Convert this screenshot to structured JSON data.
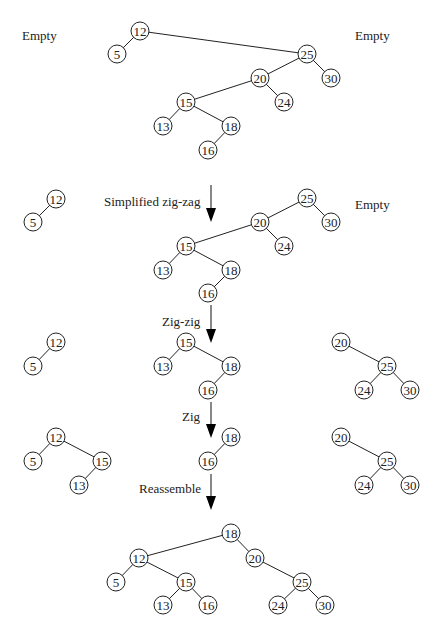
{
  "node_radius": 9,
  "labels": [
    {
      "id": "empty-left-1",
      "text": "Empty",
      "x": 22,
      "y": 40
    },
    {
      "id": "empty-right-1",
      "text": "Empty",
      "x": 355,
      "y": 40
    },
    {
      "id": "empty-right-2",
      "text": "Empty",
      "x": 355,
      "y": 209
    },
    {
      "id": "step-simplified-zig-zag",
      "text": "Simplified zig-zag",
      "x": 104,
      "y": 206
    },
    {
      "id": "step-zig-zig",
      "text": "Zig-zig",
      "x": 162,
      "y": 326
    },
    {
      "id": "step-zig",
      "text": "Zig",
      "x": 182,
      "y": 421
    },
    {
      "id": "step-reassemble",
      "text": "Reassemble",
      "x": 139,
      "y": 493
    }
  ],
  "arrows": [
    {
      "id": "arrow-simplified-zig-zag",
      "x": 211,
      "y1": 185,
      "y2": 222
    },
    {
      "id": "arrow-zig-zig",
      "x": 211,
      "y1": 305,
      "y2": 343
    },
    {
      "id": "arrow-zig",
      "x": 211,
      "y1": 402,
      "y2": 438
    },
    {
      "id": "arrow-reassemble",
      "x": 211,
      "y1": 474,
      "y2": 510
    }
  ],
  "stages": [
    {
      "name": "initial",
      "nodes": [
        {
          "id": "n12",
          "v": "12",
          "x": 140,
          "y": 31
        },
        {
          "id": "n5",
          "v": "5",
          "x": 117,
          "y": 54
        },
        {
          "id": "n25",
          "v": "25",
          "x": 307,
          "y": 54
        },
        {
          "id": "n20",
          "v": "20",
          "x": 260,
          "y": 78
        },
        {
          "id": "n30",
          "v": "30",
          "x": 331,
          "y": 78
        },
        {
          "id": "n15",
          "v": "15",
          "x": 186,
          "y": 102
        },
        {
          "id": "n24",
          "v": "24",
          "x": 284,
          "y": 102
        },
        {
          "id": "n13",
          "v": "13",
          "x": 163,
          "y": 126
        },
        {
          "id": "n18",
          "v": "18",
          "x": 231,
          "y": 126
        },
        {
          "id": "n16",
          "v": "16",
          "x": 208,
          "y": 150
        }
      ],
      "edges": [
        [
          "n12",
          "n5"
        ],
        [
          "n12",
          "n25"
        ],
        [
          "n25",
          "n20"
        ],
        [
          "n25",
          "n30"
        ],
        [
          "n20",
          "n15"
        ],
        [
          "n20",
          "n24"
        ],
        [
          "n15",
          "n13"
        ],
        [
          "n15",
          "n18"
        ],
        [
          "n18",
          "n16"
        ]
      ]
    },
    {
      "name": "after-simplified-zig-zag",
      "nodes": [
        {
          "id": "n12",
          "v": "12",
          "x": 56,
          "y": 199
        },
        {
          "id": "n5",
          "v": "5",
          "x": 33,
          "y": 222
        },
        {
          "id": "n25",
          "v": "25",
          "x": 307,
          "y": 198
        },
        {
          "id": "n20",
          "v": "20",
          "x": 260,
          "y": 222
        },
        {
          "id": "n30",
          "v": "30",
          "x": 331,
          "y": 222
        },
        {
          "id": "n15",
          "v": "15",
          "x": 186,
          "y": 246
        },
        {
          "id": "n24",
          "v": "24",
          "x": 284,
          "y": 246
        },
        {
          "id": "n13",
          "v": "13",
          "x": 163,
          "y": 270
        },
        {
          "id": "n18",
          "v": "18",
          "x": 231,
          "y": 270
        },
        {
          "id": "n16",
          "v": "16",
          "x": 208,
          "y": 293
        }
      ],
      "edges": [
        [
          "n12",
          "n5"
        ],
        [
          "n25",
          "n20"
        ],
        [
          "n25",
          "n30"
        ],
        [
          "n20",
          "n15"
        ],
        [
          "n20",
          "n24"
        ],
        [
          "n15",
          "n13"
        ],
        [
          "n15",
          "n18"
        ],
        [
          "n18",
          "n16"
        ]
      ]
    },
    {
      "name": "after-zig-zig",
      "nodes": [
        {
          "id": "n12",
          "v": "12",
          "x": 56,
          "y": 342
        },
        {
          "id": "n5",
          "v": "5",
          "x": 33,
          "y": 366
        },
        {
          "id": "n15",
          "v": "15",
          "x": 186,
          "y": 342
        },
        {
          "id": "n13",
          "v": "13",
          "x": 163,
          "y": 366
        },
        {
          "id": "n18",
          "v": "18",
          "x": 231,
          "y": 366
        },
        {
          "id": "n16",
          "v": "16",
          "x": 208,
          "y": 390
        },
        {
          "id": "n20",
          "v": "20",
          "x": 341,
          "y": 342
        },
        {
          "id": "n25",
          "v": "25",
          "x": 387,
          "y": 366
        },
        {
          "id": "n24",
          "v": "24",
          "x": 364,
          "y": 390
        },
        {
          "id": "n30",
          "v": "30",
          "x": 410,
          "y": 390
        }
      ],
      "edges": [
        [
          "n12",
          "n5"
        ],
        [
          "n15",
          "n13"
        ],
        [
          "n15",
          "n18"
        ],
        [
          "n18",
          "n16"
        ],
        [
          "n20",
          "n25"
        ],
        [
          "n25",
          "n24"
        ],
        [
          "n25",
          "n30"
        ]
      ]
    },
    {
      "name": "after-zig",
      "nodes": [
        {
          "id": "n12",
          "v": "12",
          "x": 56,
          "y": 437
        },
        {
          "id": "n5",
          "v": "5",
          "x": 33,
          "y": 461
        },
        {
          "id": "n15",
          "v": "15",
          "x": 102,
          "y": 461
        },
        {
          "id": "n13",
          "v": "13",
          "x": 79,
          "y": 485
        },
        {
          "id": "n18",
          "v": "18",
          "x": 231,
          "y": 437
        },
        {
          "id": "n16",
          "v": "16",
          "x": 208,
          "y": 461
        },
        {
          "id": "n20",
          "v": "20",
          "x": 341,
          "y": 437
        },
        {
          "id": "n25",
          "v": "25",
          "x": 387,
          "y": 461
        },
        {
          "id": "n24",
          "v": "24",
          "x": 364,
          "y": 485
        },
        {
          "id": "n30",
          "v": "30",
          "x": 410,
          "y": 485
        }
      ],
      "edges": [
        [
          "n12",
          "n5"
        ],
        [
          "n12",
          "n15"
        ],
        [
          "n15",
          "n13"
        ],
        [
          "n18",
          "n16"
        ],
        [
          "n20",
          "n25"
        ],
        [
          "n25",
          "n24"
        ],
        [
          "n25",
          "n30"
        ]
      ]
    },
    {
      "name": "reassembled",
      "nodes": [
        {
          "id": "n18",
          "v": "18",
          "x": 231,
          "y": 533
        },
        {
          "id": "n12",
          "v": "12",
          "x": 139,
          "y": 558
        },
        {
          "id": "n20",
          "v": "20",
          "x": 255,
          "y": 558
        },
        {
          "id": "n5",
          "v": "5",
          "x": 116,
          "y": 582
        },
        {
          "id": "n15",
          "v": "15",
          "x": 186,
          "y": 582
        },
        {
          "id": "n25",
          "v": "25",
          "x": 302,
          "y": 582
        },
        {
          "id": "n13",
          "v": "13",
          "x": 163,
          "y": 605
        },
        {
          "id": "n16",
          "v": "16",
          "x": 208,
          "y": 605
        },
        {
          "id": "n24",
          "v": "24",
          "x": 278,
          "y": 605
        },
        {
          "id": "n30",
          "v": "30",
          "x": 325,
          "y": 605
        }
      ],
      "edges": [
        [
          "n18",
          "n12"
        ],
        [
          "n18",
          "n20"
        ],
        [
          "n12",
          "n5"
        ],
        [
          "n12",
          "n15"
        ],
        [
          "n15",
          "n13"
        ],
        [
          "n15",
          "n16"
        ],
        [
          "n20",
          "n25"
        ],
        [
          "n25",
          "n24"
        ],
        [
          "n25",
          "n30"
        ]
      ]
    }
  ]
}
